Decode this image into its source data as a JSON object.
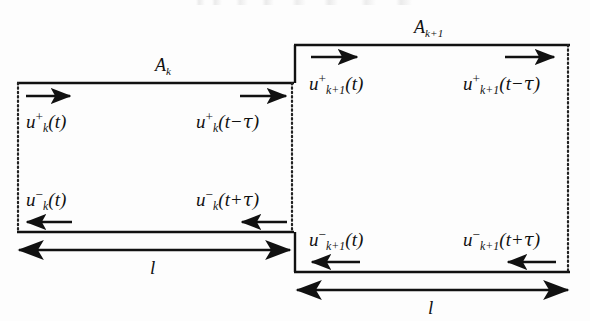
{
  "figure": {
    "background_color": "#fdfdfd",
    "line_color": "#111111",
    "dotted_edge_color": "#2a2a2a"
  },
  "sections": [
    {
      "id": "section-k",
      "area_label": {
        "base": "A",
        "subscript": "k"
      },
      "length_label": "l",
      "waves": [
        {
          "id": "wave-k-forward-in",
          "base": "u",
          "subscript": "k",
          "superscript": "+",
          "argument": "(t)",
          "arg_open": "(",
          "arg_var": "t",
          "arg_op": "",
          "arg_delay": "",
          "arg_close": ")",
          "direction": "right"
        },
        {
          "id": "wave-k-forward-out",
          "base": "u",
          "subscript": "k",
          "superscript": "+",
          "argument": "(t − τ)",
          "arg_open": "(",
          "arg_var": "t",
          "arg_op": "−",
          "arg_delay": "τ",
          "arg_close": ")",
          "direction": "right"
        },
        {
          "id": "wave-k-backward-out",
          "base": "u",
          "subscript": "k",
          "superscript": "−",
          "argument": "(t)",
          "arg_open": "(",
          "arg_var": "t",
          "arg_op": "",
          "arg_delay": "",
          "arg_close": ")",
          "direction": "left"
        },
        {
          "id": "wave-k-backward-in",
          "base": "u",
          "subscript": "k",
          "superscript": "−",
          "argument": "(t + τ)",
          "arg_open": "(",
          "arg_var": "t",
          "arg_op": "+",
          "arg_delay": "τ",
          "arg_close": ")",
          "direction": "left"
        }
      ]
    },
    {
      "id": "section-k-plus-1",
      "area_label": {
        "base": "A",
        "subscript": "k+1"
      },
      "length_label": "l",
      "waves": [
        {
          "id": "wave-k1-forward-in",
          "base": "u",
          "subscript": "k+1",
          "superscript": "+",
          "argument": "(t)",
          "arg_open": "(",
          "arg_var": "t",
          "arg_op": "",
          "arg_delay": "",
          "arg_close": ")",
          "direction": "right"
        },
        {
          "id": "wave-k1-forward-out",
          "base": "u",
          "subscript": "k+1",
          "superscript": "+",
          "argument": "(t − τ)",
          "arg_open": "(",
          "arg_var": "t",
          "arg_op": "−",
          "arg_delay": "τ",
          "arg_close": ")",
          "direction": "right"
        },
        {
          "id": "wave-k1-backward-out",
          "base": "u",
          "subscript": "k+1",
          "superscript": "−",
          "argument": "(t)",
          "arg_open": "(",
          "arg_var": "t",
          "arg_op": "",
          "arg_delay": "",
          "arg_close": ")",
          "direction": "left"
        },
        {
          "id": "wave-k1-backward-in",
          "base": "u",
          "subscript": "k+1",
          "superscript": "−",
          "argument": "(t + τ)",
          "arg_open": "(",
          "arg_var": "t",
          "arg_op": "+",
          "arg_delay": "τ",
          "arg_close": ")",
          "direction": "left"
        }
      ]
    }
  ],
  "dimensions": [
    {
      "id": "dim-l-left",
      "label": "l"
    },
    {
      "id": "dim-l-right",
      "label": "l"
    }
  ]
}
